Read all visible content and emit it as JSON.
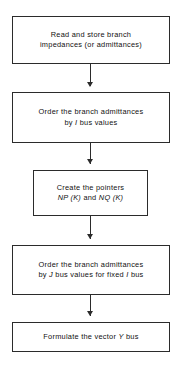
{
  "diagram": {
    "type": "flowchart",
    "orientation": "top-to-bottom",
    "background_color": "#ffffff",
    "line_color": "#2b2b2b",
    "text_color": "#111111",
    "nodes": [
      {
        "id": "node-1",
        "name": "read-store-branch-impedances",
        "shape": "rectangle",
        "text": "Read and store branch\nimpedances (or admittances)",
        "text_html": "Read and store branch\nimpedances (or admittances)"
      },
      {
        "id": "node-2",
        "name": "order-branch-admittances-by-i-bus",
        "shape": "rectangle",
        "text": "Order the branch admittances\nby I bus values",
        "text_html": "Order the branch admittances\nby <i>I</i> bus values"
      },
      {
        "id": "node-3",
        "name": "create-pointers",
        "shape": "rectangle",
        "text": "Create the pointers\nNP (K) and NQ (K)",
        "text_html": "Create the pointers\n<i>NP (K)</i> and <i>NQ (K)</i>"
      },
      {
        "id": "node-4",
        "name": "order-branch-admittances-by-j-bus",
        "shape": "rectangle",
        "text": "Order the branch admittances\nby J bus values for fixed I bus",
        "text_html": "Order the branch admittances\nby <i>J</i> bus values for fixed <i>I</i> bus"
      },
      {
        "id": "node-5",
        "name": "formulate-vector-y-bus",
        "shape": "rectangle",
        "text": "Formulate the vector Y bus",
        "text_html": "Formulate the vector <i>Y</i> bus"
      }
    ],
    "connectors": [
      {
        "id": "connector-1",
        "from": "node-1",
        "to": "node-2",
        "arrow": "down"
      },
      {
        "id": "connector-2",
        "from": "node-2",
        "to": "node-3",
        "arrow": "down"
      },
      {
        "id": "connector-3",
        "from": "node-3",
        "to": "node-4",
        "arrow": "down"
      },
      {
        "id": "connector-4",
        "from": "node-4",
        "to": "node-5",
        "arrow": "down"
      }
    ]
  }
}
